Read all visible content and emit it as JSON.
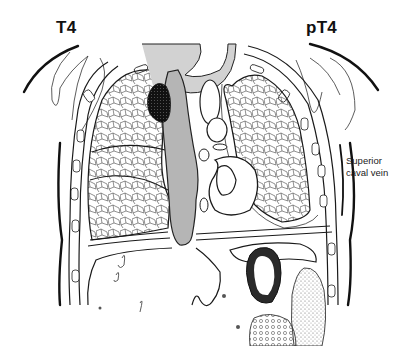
{
  "diagram": {
    "type": "anatomical-coronal-chest-section",
    "labels": {
      "left_stage": "T4",
      "right_stage": "pT4",
      "annotation": [
        "Superior",
        "caval vein"
      ]
    },
    "structures": [
      "left-lung",
      "right-lung",
      "tumor-mass",
      "superior-caval-vein",
      "trachea",
      "aortic-arch",
      "heart",
      "diaphragm",
      "liver",
      "stomach",
      "kidney",
      "spleen",
      "ribs",
      "chest-wall"
    ],
    "colors": {
      "line": "#1a1a1a",
      "vein_fill": "#b8b8b8",
      "trachea_fill": "#d0d0d0",
      "tumor": "#111111",
      "spleen_stipple": "#9a9a9a",
      "background": "#ffffff"
    }
  }
}
